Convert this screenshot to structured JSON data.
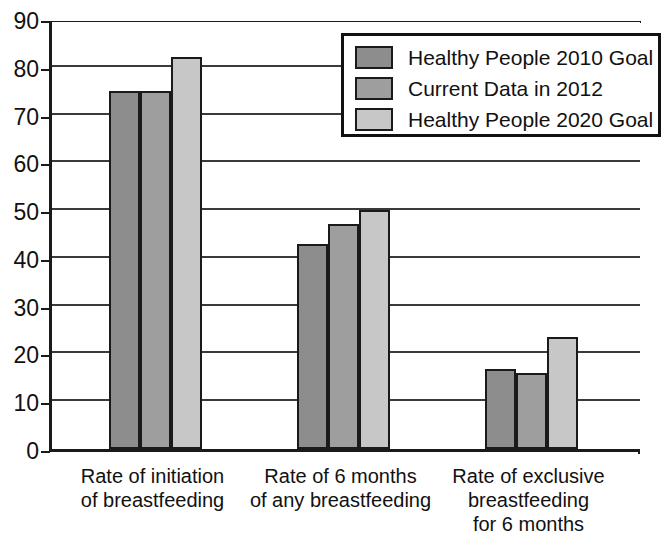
{
  "chart_data": {
    "type": "bar",
    "title": "",
    "subtitle": "",
    "xlabel": "",
    "ylabel": "",
    "ylim": [
      0,
      90
    ],
    "yticks": [
      0,
      10,
      20,
      30,
      40,
      50,
      60,
      70,
      80,
      90
    ],
    "ytick_labels": [
      "0",
      "10",
      "20",
      "30",
      "40",
      "50",
      "60",
      "70",
      "80",
      "90"
    ],
    "grid": true,
    "legend_position": "top-right",
    "categories": [
      "Rate of initiation\nof breastfeeding",
      "Rate of 6 months\nof any breastfeeding",
      "Rate of exclusive\nbreastfeeding\nfor 6 months"
    ],
    "series": [
      {
        "name": "Healthy People 2010 Goal",
        "color": "#8d8d8d",
        "values": [
          75,
          43,
          16.7
        ]
      },
      {
        "name": "Current Data in 2012",
        "color": "#9e9e9e",
        "values": [
          75,
          47,
          16
        ]
      },
      {
        "name": "Healthy People 2020 Goal",
        "color": "#c7c7c7",
        "values": [
          82,
          50,
          23.4
        ]
      }
    ]
  },
  "legend": {
    "entries": [
      {
        "label": "Healthy People 2010 Goal",
        "color": "#8d8d8d"
      },
      {
        "label": "Current Data in 2012",
        "color": "#9e9e9e"
      },
      {
        "label": "Healthy People 2020 Goal",
        "color": "#c7c7c7"
      }
    ]
  },
  "axis": {
    "y_labels": [
      "90",
      "80",
      "70",
      "60",
      "50",
      "40",
      "30",
      "20",
      "10",
      "0"
    ],
    "x_labels": [
      "Rate of initiation\nof breastfeeding",
      "Rate of 6 months\nof any breastfeeding",
      "Rate of exclusive\nbreastfeeding\nfor 6 months"
    ]
  },
  "colors": {
    "axis": "#1a1a1a",
    "grid": "#3a3a3a",
    "background": "#ffffff",
    "series_1": "#8d8d8d",
    "series_2": "#9e9e9e",
    "series_3": "#c7c7c7"
  }
}
